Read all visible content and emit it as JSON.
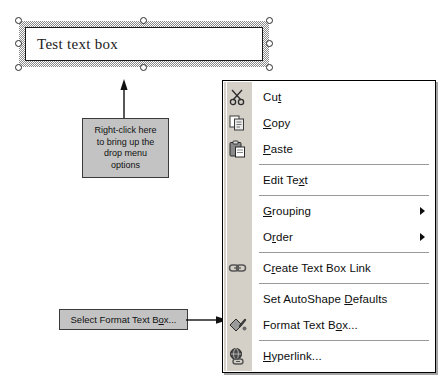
{
  "textbox": {
    "value": "Test text box",
    "handles": [
      "top-left",
      "top-center",
      "top-right",
      "middle-left",
      "middle-right",
      "bottom-left",
      "bottom-center",
      "bottom-right"
    ]
  },
  "callouts": {
    "right_click": {
      "line1": "Right-click here",
      "line2": "to bring up the",
      "line3": "drop menu",
      "line4": "options"
    },
    "select_format": {
      "pre": "Select Format Text B",
      "accel": "o",
      "post": "x..."
    }
  },
  "context_menu": {
    "items": [
      {
        "id": "cut",
        "pre": "Cu",
        "accel": "t",
        "post": "",
        "icon": "scissors-icon",
        "submenu": false
      },
      {
        "id": "copy",
        "pre": "",
        "accel": "C",
        "post": "opy",
        "icon": "copy-icon",
        "submenu": false
      },
      {
        "id": "paste",
        "pre": "",
        "accel": "P",
        "post": "aste",
        "icon": "clipboard-icon",
        "submenu": false
      },
      {
        "id": "separator-1",
        "type": "separator"
      },
      {
        "id": "edit-text",
        "pre": "Edit Te",
        "accel": "x",
        "post": "t",
        "icon": "",
        "submenu": false
      },
      {
        "id": "separator-2",
        "type": "separator"
      },
      {
        "id": "grouping",
        "pre": "",
        "accel": "G",
        "post": "rouping",
        "icon": "",
        "submenu": true
      },
      {
        "id": "order",
        "pre": "O",
        "accel": "r",
        "post": "der",
        "icon": "",
        "submenu": true
      },
      {
        "id": "separator-3",
        "type": "separator"
      },
      {
        "id": "create-link",
        "pre": "C",
        "accel": "r",
        "post": "eate Text Box Link",
        "icon": "chain-link-icon",
        "submenu": false
      },
      {
        "id": "separator-4",
        "type": "separator"
      },
      {
        "id": "autoshape",
        "pre": "Set AutoShape ",
        "accel": "D",
        "post": "efaults",
        "icon": "",
        "submenu": false
      },
      {
        "id": "format-textbox",
        "pre": "Format Text B",
        "accel": "o",
        "post": "x...",
        "icon": "paint-bucket-icon",
        "submenu": false
      },
      {
        "id": "separator-5",
        "type": "separator"
      },
      {
        "id": "hyperlink",
        "pre": "",
        "accel": "H",
        "post": "yperlink...",
        "icon": "globe-link-icon",
        "submenu": false
      }
    ]
  },
  "colors": {
    "callout_fill": "#c3c3c3",
    "menu_gutter": "#d4d0c8",
    "menu_bg": "#ffffff",
    "text": "#0d0d0d",
    "separator": "#9a9a9a"
  }
}
